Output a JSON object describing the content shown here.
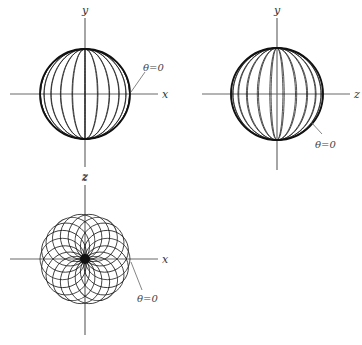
{
  "figure": {
    "panels": [
      {
        "id": "xy-projection",
        "horizontal_axis_label": "x",
        "vertical_axis_top_label": "y",
        "vertical_axis_bottom_label": "z",
        "annotation": "θ=0",
        "center": [
          85,
          94
        ],
        "radius": 45
      },
      {
        "id": "zy-projection",
        "horizontal_axis_label": "z",
        "vertical_axis_top_label": "y",
        "annotation": "θ=0",
        "center": [
          277,
          94
        ],
        "radius": 46
      },
      {
        "id": "xz-projection",
        "horizontal_axis_label": "x",
        "vertical_axis_top_label": "z",
        "annotation": "θ=0",
        "center": [
          85,
          259
        ],
        "radius": 45
      }
    ],
    "colors": {
      "curve": "#1a1a1a",
      "axis": "#6a6a6a",
      "background": "#ffffff"
    }
  }
}
